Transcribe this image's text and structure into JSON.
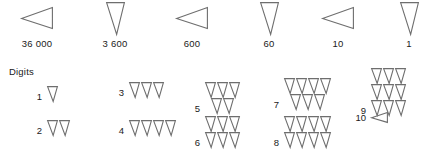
{
  "figure": {
    "title_text": "Digits",
    "stroke_color": "#6e6e6e",
    "text_color": "#1a1a1a",
    "background_color": "#ffffff"
  },
  "place_values": {
    "cells": [
      {
        "label": "36 000",
        "symbol": "left-wedge-icon"
      },
      {
        "label": "3 600",
        "symbol": "down-wedge-icon"
      },
      {
        "label": "600",
        "symbol": "left-wedge-icon"
      },
      {
        "label": "60",
        "symbol": "down-wedge-icon"
      },
      {
        "label": "10",
        "symbol": "left-wedge-icon"
      },
      {
        "label": "1",
        "symbol": "down-wedge-icon"
      }
    ]
  },
  "digits": {
    "heading": "Digits",
    "entries": [
      {
        "number": "1",
        "symbol": "down-wedge-icon",
        "rows": [
          1
        ]
      },
      {
        "number": "2",
        "symbol": "down-wedge-icon",
        "rows": [
          2
        ]
      },
      {
        "number": "3",
        "symbol": "down-wedge-icon",
        "rows": [
          3
        ]
      },
      {
        "number": "4",
        "symbol": "down-wedge-icon",
        "rows": [
          4
        ]
      },
      {
        "number": "5",
        "symbol": "down-wedge-icon",
        "rows": [
          3,
          2
        ]
      },
      {
        "number": "6",
        "symbol": "down-wedge-icon",
        "rows": [
          3,
          3
        ]
      },
      {
        "number": "7",
        "symbol": "down-wedge-icon",
        "rows": [
          4,
          3
        ]
      },
      {
        "number": "8",
        "symbol": "down-wedge-icon",
        "rows": [
          4,
          4
        ]
      },
      {
        "number": "9",
        "symbol": "down-wedge-icon",
        "rows": [
          3,
          3,
          3
        ]
      },
      {
        "number": "10",
        "symbol": "left-wedge-icon",
        "rows": [
          1
        ]
      }
    ]
  }
}
